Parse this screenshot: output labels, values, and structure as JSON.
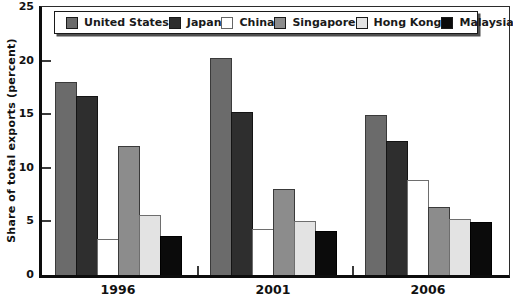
{
  "chart_data": {
    "type": "bar",
    "title": "",
    "ylabel": "Share of total exports (percent)",
    "xlabel": "",
    "ylim": [
      0,
      25
    ],
    "y_ticks": [
      0,
      5,
      10,
      15,
      20,
      25
    ],
    "grid": false,
    "legend_position": "top-inside-horizontal",
    "categories": [
      "1996",
      "2001",
      "2006"
    ],
    "series": [
      {
        "name": "United States",
        "color": "#6b6b6b",
        "border": "#3a3a3a",
        "textured": false,
        "values": [
          18.0,
          20.2,
          14.9
        ]
      },
      {
        "name": "Japan",
        "color": "#2e2e2e",
        "border": "#141414",
        "textured": true,
        "values": [
          16.7,
          15.2,
          12.5
        ]
      },
      {
        "name": "China",
        "color": "#ffffff",
        "border": "#6e6e6e",
        "textured": false,
        "values": [
          3.4,
          4.3,
          8.9
        ]
      },
      {
        "name": "Singapore",
        "color": "#8c8c8c",
        "border": "#3a3a3a",
        "textured": false,
        "values": [
          12.0,
          8.0,
          6.3
        ]
      },
      {
        "name": "Hong Kong",
        "color": "#e3e3e3",
        "border": "#6e6e6e",
        "textured": false,
        "values": [
          5.6,
          5.0,
          5.2
        ]
      },
      {
        "name": "Malaysia",
        "color": "#0b0b0b",
        "border": "#000000",
        "textured": false,
        "values": [
          3.6,
          4.1,
          4.9
        ]
      }
    ]
  }
}
